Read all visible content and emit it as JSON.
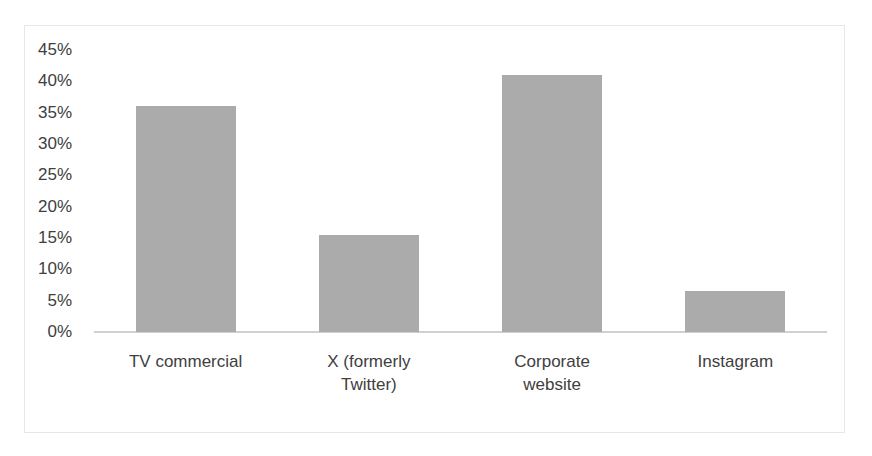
{
  "chart_data": {
    "type": "bar",
    "title": "",
    "xlabel": "",
    "ylabel": "",
    "categories": [
      "TV commercial",
      "X (formerly Twitter)",
      "Corporate website",
      "Instagram"
    ],
    "category_lines": [
      [
        "TV commercial"
      ],
      [
        "X (formerly",
        "Twitter)"
      ],
      [
        "Corporate",
        "website"
      ],
      [
        "Instagram"
      ]
    ],
    "values": [
      0.36,
      0.155,
      0.41,
      0.065
    ],
    "ylim": [
      0,
      0.45
    ],
    "yticks": [
      "0%",
      "5%",
      "10%",
      "15%",
      "20%",
      "25%",
      "30%",
      "35%",
      "40%",
      "45%"
    ],
    "grid": false,
    "legend": null,
    "bar_color": "#ababab"
  }
}
